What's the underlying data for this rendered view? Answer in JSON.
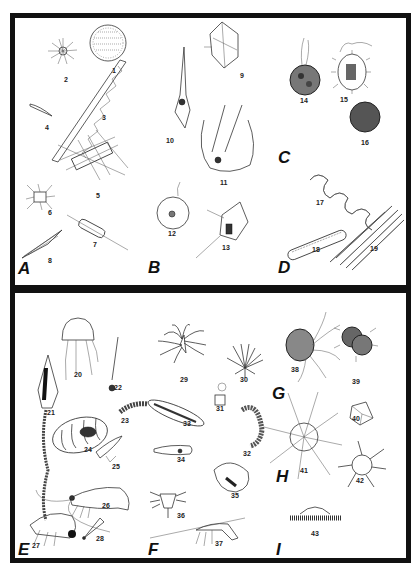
{
  "plate": {
    "panels": [
      {
        "id": "top",
        "groups": [
          "A",
          "B",
          "C",
          "D"
        ]
      },
      {
        "id": "bottom",
        "groups": [
          "E",
          "F",
          "G",
          "H",
          "I"
        ]
      }
    ],
    "groups": {
      "A": "A",
      "B": "B",
      "C": "C",
      "D": "D",
      "E": "E",
      "F": "F",
      "G": "G",
      "H": "H",
      "I": "I"
    },
    "figures": {
      "f1": "1",
      "f2": "2",
      "f3": "3",
      "f4": "4",
      "f5": "5",
      "f6": "6",
      "f7": "7",
      "f8": "8",
      "f9": "9",
      "f10": "10",
      "f11": "11",
      "f12": "12",
      "f13": "13",
      "f14": "14",
      "f15": "15",
      "f16": "16",
      "f17": "17",
      "f18": "18",
      "f19": "19",
      "f20": "20",
      "f21": "21",
      "f22": "22",
      "f23": "23",
      "f24": "24",
      "f25": "25",
      "f26": "26",
      "f27": "27",
      "f28": "28",
      "f29": "29",
      "f30": "30",
      "f31": "31",
      "f32": "32",
      "f33": "33",
      "f34": "34",
      "f35": "35",
      "f36": "36",
      "f37": "37",
      "f38": "38",
      "f39": "39",
      "f40": "40",
      "f41": "41",
      "f42": "42",
      "f43": "43"
    },
    "colors": {
      "border": "#111111",
      "background": "#ffffff",
      "ink": "#222222"
    }
  }
}
